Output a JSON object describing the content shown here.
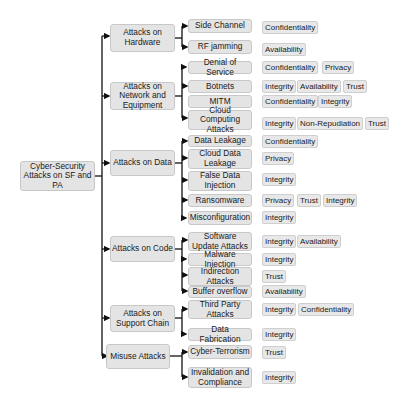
{
  "root": {
    "label": "Cyber-Security Attacks on SF and PA"
  },
  "categories": [
    {
      "label": "Attacks on Hardware",
      "attacks": [
        {
          "label": "Side Channel",
          "properties": [
            "Confidentiality"
          ]
        },
        {
          "label": "RF jamming",
          "properties": [
            "Availability"
          ]
        }
      ]
    },
    {
      "label": "Attacks on Network and Equipment",
      "attacks": [
        {
          "label": "Denial of Service",
          "properties": [
            "Confidentiality",
            "Privacy"
          ]
        },
        {
          "label": "Botnets",
          "properties": [
            "Integrity",
            "Availability",
            "Trust"
          ]
        },
        {
          "label": "MITM",
          "properties": [
            "Confidentiality",
            "Integrity"
          ]
        },
        {
          "label": "Cloud Computing Attacks",
          "properties": [
            "Integrity",
            "Non-Repudiation",
            "Trust"
          ]
        }
      ]
    },
    {
      "label": "Attacks on Data",
      "attacks": [
        {
          "label": "Data Leakage",
          "properties": [
            "Confidentiality"
          ]
        },
        {
          "label": "Cloud Data Leakage",
          "properties": [
            "Privacy"
          ]
        },
        {
          "label": "False Data Injection",
          "properties": [
            "Integrity"
          ]
        },
        {
          "label": "Ransomware",
          "properties": [
            "Privacy",
            "Trust",
            "Integrity"
          ]
        },
        {
          "label": "Misconfiguration",
          "properties": [
            "Integrity"
          ]
        }
      ]
    },
    {
      "label": "Attacks on Code",
      "attacks": [
        {
          "label": "Software Update Attacks",
          "properties": [
            "Integrity",
            "Availability"
          ]
        },
        {
          "label": "Malware Injection",
          "properties": [
            "Integrity"
          ]
        },
        {
          "label": "Indirection Attacks",
          "properties": [
            "Trust"
          ]
        },
        {
          "label": "Buffer overflow",
          "properties": [
            "Availability"
          ]
        }
      ]
    },
    {
      "label": "Attacks on Support Chain",
      "attacks": [
        {
          "label": "Third Party Attacks",
          "properties": [
            "Integrity",
            "Confidentiality"
          ]
        },
        {
          "label": "Data Fabrication",
          "properties": [
            "Integrity"
          ]
        }
      ]
    },
    {
      "label": "Misuse Attacks",
      "attacks": [
        {
          "label": "Cyber-Terrorism",
          "properties": [
            "Trust"
          ]
        },
        {
          "label": "Invalidation and Compliance",
          "properties": [
            "Integrity"
          ]
        }
      ]
    }
  ]
}
